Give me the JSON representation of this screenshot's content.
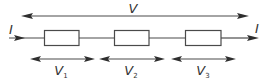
{
  "diagram": {
    "current_label": "I",
    "total_voltage_label": "V",
    "resistors": [
      {
        "name": "R1",
        "voltage_label": "V",
        "voltage_subscript": "1"
      },
      {
        "name": "R2",
        "voltage_label": "V",
        "voltage_subscript": "2"
      },
      {
        "name": "R3",
        "voltage_label": "V",
        "voltage_subscript": "3"
      }
    ],
    "colors": {
      "stroke": "#4a4a4a",
      "arrowhead": "#2e2e2e",
      "text": "#333333",
      "background": "#ffffff"
    }
  }
}
